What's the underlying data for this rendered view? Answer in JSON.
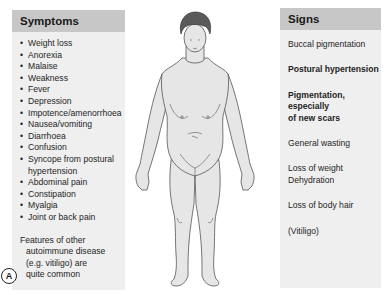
{
  "symptoms": {
    "title": "Symptoms",
    "items": [
      "Weight loss",
      "Anorexia",
      "Malaise",
      "Weakness",
      "Fever",
      "Depression",
      "Impotence/amenorrhoea",
      "Nausea/vomiting",
      "Diarrhoea",
      "Confusion",
      "Syncope from postural",
      "Abdominal pain",
      "Constipation",
      "Myalgia",
      "Joint or back pain"
    ],
    "item_continuation": "hypertension",
    "features_lines": [
      "Features of other",
      "autoimmune disease",
      "(e.g. vitiligo) are",
      "quite common"
    ]
  },
  "signs": {
    "title": "Signs",
    "items": [
      {
        "text": "Buccal pigmentation",
        "bold": false
      },
      {
        "text": "Postural hypertension",
        "bold": true
      },
      {
        "text": "Pigmentation, especially",
        "bold": true
      },
      {
        "text": "of new scars",
        "bold": true
      },
      {
        "text": "General wasting",
        "bold": false
      },
      {
        "text": "Loss of weight",
        "bold": false
      },
      {
        "text": "Dehydration",
        "bold": false
      },
      {
        "text": "Loss of body hair",
        "bold": false
      },
      {
        "text": "(Vitiligo)",
        "bold": false
      }
    ]
  },
  "figure": {
    "panel_label": "A"
  },
  "colors": {
    "panel_bg": "#efefef",
    "header_bg": "#c7c7c7",
    "body_fill": "#e6e6e6",
    "hair": "#555555",
    "outline": "#555555"
  }
}
